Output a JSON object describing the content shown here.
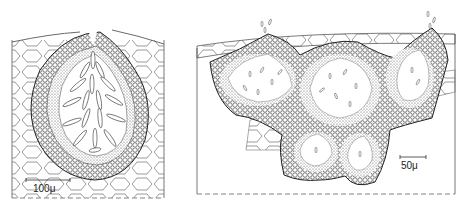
{
  "figure": {
    "panels": [
      {
        "id": "left",
        "subject": "pycnidium in cross-section with elongate conidia",
        "scale_bar_label": "100μ"
      },
      {
        "id": "right",
        "subject": "multilocular stroma with conidia",
        "scale_bar_label": "50μ"
      }
    ]
  },
  "colors": {
    "ink": "#2a2a2a",
    "paper": "#ffffff",
    "stipple": "#555555"
  }
}
